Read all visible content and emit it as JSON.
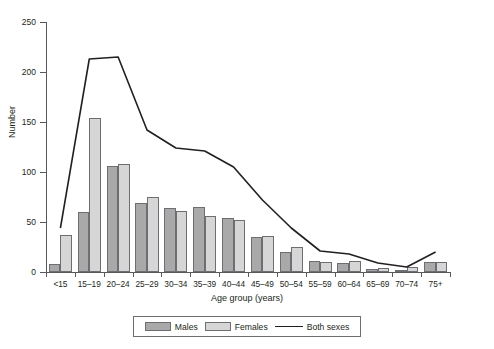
{
  "chart_data": {
    "type": "bar",
    "title": "",
    "subtitle": "",
    "xlabel": "Age group (years)",
    "ylabel": "Number",
    "ylim": [
      0,
      250
    ],
    "yticks": [
      0,
      50,
      100,
      150,
      200,
      250
    ],
    "grid": false,
    "legend_position": "bottom",
    "categories": [
      "<15",
      "15–19",
      "20–24",
      "25–29",
      "30–34",
      "35–39",
      "40–44",
      "45–49",
      "50–54",
      "55–59",
      "60–64",
      "65–69",
      "70–74",
      "75+"
    ],
    "series": [
      {
        "name": "Males",
        "type": "bar",
        "color": "#a9a9a9",
        "values": [
          8,
          60,
          106,
          69,
          64,
          65,
          54,
          35,
          20,
          11,
          9,
          3,
          1,
          10
        ]
      },
      {
        "name": "Females",
        "type": "bar",
        "color": "#d6d6d6",
        "values": [
          37,
          154,
          108,
          75,
          61,
          56,
          52,
          36,
          25,
          10,
          11,
          4,
          5,
          10
        ]
      },
      {
        "name": "Both sexes",
        "type": "line",
        "color": "#231f20",
        "values": [
          44,
          213,
          215,
          142,
          124,
          121,
          105,
          72,
          44,
          21,
          18,
          9,
          5,
          20
        ]
      }
    ]
  },
  "legend": {
    "males_label": "Males",
    "females_label": "Females",
    "both_label": "Both sexes"
  }
}
